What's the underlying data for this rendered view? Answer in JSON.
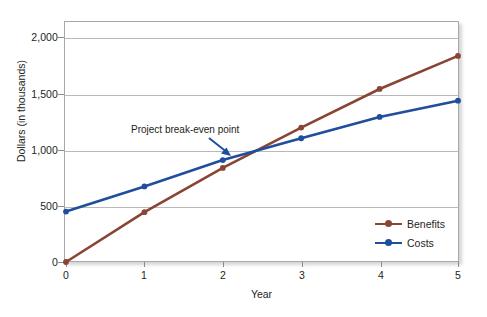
{
  "chart_data": {
    "type": "line",
    "title": "",
    "xlabel": "Year",
    "ylabel": "Dollars (in thousands)",
    "x": [
      0,
      1,
      2,
      3,
      4,
      5
    ],
    "xtick_labels": [
      "0",
      "1",
      "2",
      "3",
      "4",
      "5"
    ],
    "ytick_values": [
      0,
      500,
      1000,
      1500,
      2000
    ],
    "ytick_labels": [
      "0",
      "500",
      "1,000",
      "1,500",
      "2,000"
    ],
    "xlim": [
      0,
      5
    ],
    "ylim": [
      0,
      2100
    ],
    "grid": "horizontal",
    "legend_position": "lower-right",
    "series": [
      {
        "name": "Benefits",
        "color": "#8a4433",
        "values": [
          0,
          445,
          840,
          1200,
          1545,
          1840
        ]
      },
      {
        "name": "Costs",
        "color": "#1f4e9c",
        "values": [
          450,
          675,
          910,
          1105,
          1295,
          1440
        ]
      }
    ],
    "annotations": [
      {
        "text": "Project break-even point",
        "arrow_color": "#1f4e9c",
        "target_x": 2.37,
        "target_y": 985
      }
    ]
  },
  "colors": {
    "benefits": "#8a4433",
    "costs": "#1f4e9c",
    "grid": "#b9b9b9",
    "frame": "#a8a8a8",
    "text": "#231f20"
  }
}
